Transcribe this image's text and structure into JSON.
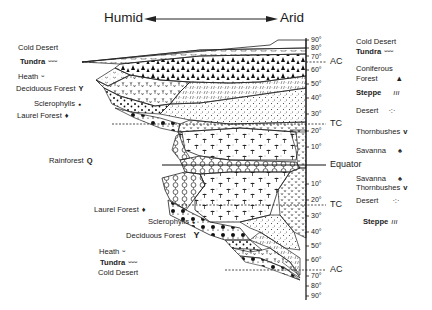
{
  "header": {
    "left_label": "Humid",
    "right_label": "Arid"
  },
  "axis": {
    "north_ticks": [
      "90°",
      "80°",
      "70°",
      "60°",
      "50°",
      "40°",
      "30°",
      "20°",
      "10°"
    ],
    "south_ticks": [
      "10°",
      "20°",
      "30°",
      "40°",
      "50°",
      "60°",
      "70°",
      "80°",
      "90°"
    ],
    "markers": {
      "arctic_circle_n": "AC",
      "tropic_n": "TC",
      "equator": "Equator",
      "tropic_s": "TC",
      "arctic_circle_s": "AC"
    }
  },
  "left_legend_north": [
    {
      "label": "Cold Desert",
      "symbol": ""
    },
    {
      "label": "Tundra",
      "symbol": "ᵕᵕᵕ"
    },
    {
      "label": "Heath",
      "symbol": "ᵕ"
    },
    {
      "label": "Deciduous Forest",
      "symbol": "Y"
    },
    {
      "label": "Sclerophylls",
      "symbol": "●"
    },
    {
      "label": "Laurel Forest",
      "symbol": "♦"
    }
  ],
  "left_legend_equator": {
    "label": "Rainforest",
    "symbol": "Q"
  },
  "left_legend_south": [
    {
      "label": "Laurel Forest",
      "symbol": "♦"
    },
    {
      "label": "Sclerophylls",
      "symbol": "●"
    },
    {
      "label": "Deciduous Forest",
      "symbol": "Y"
    },
    {
      "label": "Heath",
      "symbol": "ᵕ"
    },
    {
      "label": "Tundra",
      "symbol": "ᵕᵕᵕ"
    },
    {
      "label": "Cold Desert",
      "symbol": ""
    }
  ],
  "right_legend_north": [
    {
      "label": "Cold Desert",
      "symbol": ""
    },
    {
      "label": "Tundra",
      "symbol": "ᵕᵕᵕ"
    },
    {
      "label": "Coniferous",
      "symbol": ""
    },
    {
      "label": "Forest",
      "symbol": "▲"
    },
    {
      "label": "Steppe",
      "symbol": "ııı"
    },
    {
      "label": "Desert",
      "symbol": "·:·"
    },
    {
      "label": "Thornbushes",
      "symbol": "v"
    },
    {
      "label": "Savanna",
      "symbol": "♠"
    }
  ],
  "right_legend_south": [
    {
      "label": "Savanna",
      "symbol": "♠"
    },
    {
      "label": "Thornbushes",
      "symbol": "v"
    },
    {
      "label": "Desert",
      "symbol": "·:·"
    },
    {
      "label": "Steppe",
      "symbol": "ııı"
    }
  ]
}
